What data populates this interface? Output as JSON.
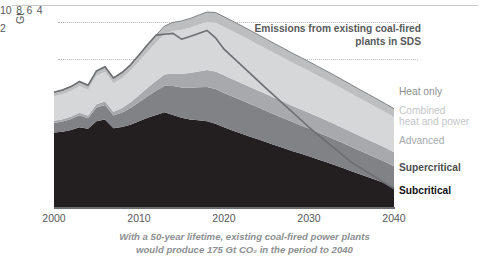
{
  "figure": {
    "unit_label": "Gt",
    "annotation": {
      "line1": "Emissions from existing coal-fired",
      "line2": "plants in SDS"
    },
    "caption": {
      "line1": "With a 50-year lifetime, existing coal-fired power plants",
      "line2": "would produce 175 Gt CO₂ in the period to 2040"
    },
    "legend": {
      "heat_only": "Heat only",
      "chp_line1": "Combined",
      "chp_line2": "heat and power",
      "advanced": "Advanced",
      "supercritical": "Supercritical",
      "subcritical": "Subcritical"
    }
  },
  "chart_data": {
    "type": "area",
    "title": "",
    "subtitle": "",
    "xlabel": "",
    "ylabel": "Gt",
    "xlim": [
      2000,
      2040
    ],
    "ylim": [
      0,
      10.6
    ],
    "xticks": [
      2000,
      2010,
      2020,
      2030,
      2040
    ],
    "ytick_labels": [
      "2",
      "4",
      "6",
      "8",
      "10"
    ],
    "yticks": [
      2,
      4,
      6,
      8,
      10
    ],
    "grid": "horizontal-dotted-at-8-and-10",
    "legend_position": "right",
    "stacked": true,
    "x": [
      2000,
      2001,
      2002,
      2003,
      2004,
      2005,
      2006,
      2007,
      2008,
      2009,
      2010,
      2011,
      2012,
      2013,
      2014,
      2015,
      2016,
      2017,
      2018,
      2019,
      2020,
      2021,
      2022,
      2023,
      2024,
      2025,
      2026,
      2027,
      2028,
      2029,
      2030,
      2031,
      2032,
      2033,
      2034,
      2035,
      2036,
      2037,
      2038,
      2039,
      2040
    ],
    "series": [
      {
        "name": "Subcritical",
        "color": "#231f20",
        "values": [
          4.3,
          4.35,
          4.45,
          4.6,
          4.52,
          4.95,
          5.05,
          4.55,
          4.62,
          4.75,
          4.95,
          5.15,
          5.3,
          5.45,
          5.3,
          5.15,
          5.05,
          5.0,
          4.95,
          4.8,
          4.6,
          4.42,
          4.25,
          4.08,
          3.92,
          3.75,
          3.58,
          3.42,
          3.25,
          3.1,
          2.95,
          2.78,
          2.62,
          2.45,
          2.28,
          2.1,
          1.92,
          1.75,
          1.58,
          1.4,
          1.2
        ]
      },
      {
        "name": "Supercritical",
        "color": "#808285",
        "values": [
          0.55,
          0.58,
          0.62,
          0.68,
          0.6,
          0.78,
          0.82,
          0.72,
          0.82,
          0.95,
          1.08,
          1.22,
          1.38,
          1.52,
          1.65,
          1.72,
          1.8,
          1.88,
          1.95,
          1.98,
          1.96,
          1.93,
          1.9,
          1.86,
          1.82,
          1.78,
          1.74,
          1.7,
          1.66,
          1.62,
          1.58,
          1.54,
          1.5,
          1.46,
          1.42,
          1.38,
          1.34,
          1.3,
          1.26,
          1.22,
          1.18
        ]
      },
      {
        "name": "Advanced",
        "color": "#a7a9ac",
        "values": [
          0.12,
          0.13,
          0.14,
          0.15,
          0.14,
          0.18,
          0.2,
          0.22,
          0.26,
          0.32,
          0.4,
          0.48,
          0.56,
          0.64,
          0.72,
          0.78,
          0.84,
          0.9,
          0.96,
          1.0,
          1.0,
          0.99,
          0.98,
          0.97,
          0.96,
          0.95,
          0.94,
          0.93,
          0.92,
          0.91,
          0.9,
          0.89,
          0.88,
          0.87,
          0.86,
          0.85,
          0.84,
          0.83,
          0.82,
          0.81,
          0.8
        ]
      },
      {
        "name": "Combined heat and power",
        "color": "#d5d7d8",
        "values": [
          1.4,
          1.42,
          1.46,
          1.52,
          1.48,
          1.62,
          1.68,
          1.62,
          1.7,
          1.8,
          1.92,
          2.05,
          2.18,
          2.3,
          2.42,
          2.5,
          2.58,
          2.66,
          2.74,
          2.78,
          2.76,
          2.73,
          2.7,
          2.66,
          2.62,
          2.58,
          2.54,
          2.5,
          2.46,
          2.42,
          2.38,
          2.34,
          2.3,
          2.26,
          2.22,
          2.18,
          2.14,
          2.1,
          2.06,
          2.02,
          2.0
        ]
      },
      {
        "name": "Heat only",
        "color": "#bcbec0",
        "values": [
          0.23,
          0.24,
          0.25,
          0.26,
          0.25,
          0.28,
          0.3,
          0.3,
          0.32,
          0.34,
          0.37,
          0.4,
          0.43,
          0.46,
          0.49,
          0.51,
          0.53,
          0.55,
          0.57,
          0.58,
          0.58,
          0.58,
          0.57,
          0.57,
          0.56,
          0.56,
          0.55,
          0.55,
          0.54,
          0.54,
          0.53,
          0.53,
          0.52,
          0.52,
          0.51,
          0.51,
          0.5,
          0.5,
          0.49,
          0.49,
          0.48
        ]
      }
    ],
    "total_values": [
      6.6,
      6.72,
      6.92,
      7.21,
      6.99,
      7.81,
      8.05,
      7.41,
      7.72,
      8.16,
      8.72,
      9.3,
      9.85,
      10.37,
      10.58,
      10.66,
      10.8,
      10.99,
      11.17,
      11.14,
      10.9,
      10.65,
      10.4,
      10.14,
      9.88,
      9.62,
      9.35,
      9.1,
      8.83,
      8.59,
      8.34,
      8.08,
      7.82,
      7.56,
      7.31,
      7.02,
      6.74,
      6.48,
      6.21,
      5.94,
      5.66
    ],
    "overlay_line": {
      "name": "Emissions from existing coal-fired plants in SDS",
      "color": "#6d6e71",
      "x": [
        2000,
        2001,
        2002,
        2003,
        2004,
        2005,
        2006,
        2007,
        2008,
        2009,
        2010,
        2011,
        2012,
        2013,
        2014,
        2015,
        2016,
        2017,
        2018,
        2019,
        2020,
        2025,
        2030,
        2035,
        2040
      ],
      "values": [
        6.6,
        6.72,
        6.92,
        7.21,
        6.99,
        7.81,
        8.05,
        7.41,
        7.72,
        8.16,
        8.72,
        9.3,
        9.85,
        9.9,
        9.95,
        9.62,
        9.78,
        9.95,
        10.12,
        9.7,
        9.05,
        6.8,
        4.6,
        2.6,
        1.1
      ]
    }
  }
}
